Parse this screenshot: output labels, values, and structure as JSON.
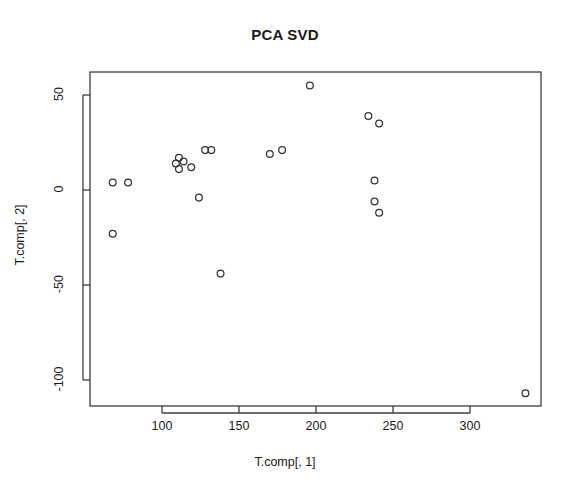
{
  "chart_data": {
    "type": "scatter",
    "title": "PCA SVD",
    "xlabel": "T.comp[, 1]",
    "ylabel": "T.comp[, 2]",
    "xlim": [
      58,
      348
    ],
    "ylim": [
      -117,
      63
    ],
    "grid": false,
    "legend": null,
    "marker": "open-circle",
    "marker_color": "#333333",
    "xticks": [
      100,
      150,
      200,
      250,
      300
    ],
    "xtick_labels": [
      "100",
      "150",
      "200",
      "250",
      "300"
    ],
    "yticks": [
      50,
      0,
      -50,
      -100
    ],
    "ytick_labels": [
      "50",
      "0",
      "-50",
      "-100"
    ],
    "n_points": 21,
    "x": [
      68,
      78,
      68,
      109,
      111,
      114,
      111,
      119,
      128,
      132,
      124,
      138,
      170,
      178,
      196,
      234,
      241,
      238,
      238,
      241,
      336
    ],
    "y": [
      4,
      4,
      -23,
      14,
      17,
      15,
      11,
      12,
      21,
      21,
      -4,
      -44,
      19,
      21,
      55,
      39,
      35,
      5,
      -6,
      -12,
      -107
    ],
    "points": [
      {
        "x": 68,
        "y": 4
      },
      {
        "x": 78,
        "y": 4
      },
      {
        "x": 68,
        "y": -23
      },
      {
        "x": 109,
        "y": 14
      },
      {
        "x": 111,
        "y": 17
      },
      {
        "x": 114,
        "y": 15
      },
      {
        "x": 111,
        "y": 11
      },
      {
        "x": 119,
        "y": 12
      },
      {
        "x": 128,
        "y": 21
      },
      {
        "x": 132,
        "y": 21
      },
      {
        "x": 124,
        "y": -4
      },
      {
        "x": 138,
        "y": -44
      },
      {
        "x": 170,
        "y": 19
      },
      {
        "x": 178,
        "y": 21
      },
      {
        "x": 196,
        "y": 55
      },
      {
        "x": 234,
        "y": 39
      },
      {
        "x": 241,
        "y": 35
      },
      {
        "x": 238,
        "y": 5
      },
      {
        "x": 238,
        "y": -6
      },
      {
        "x": 241,
        "y": -12
      },
      {
        "x": 336,
        "y": -107
      }
    ]
  },
  "axes": {
    "frame_color": "#3c3c3c",
    "tick_color": "#3c3c3c",
    "background": "#ffffff"
  }
}
